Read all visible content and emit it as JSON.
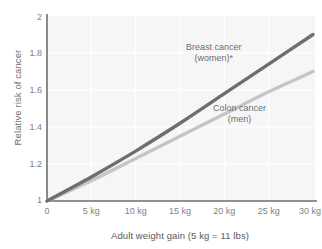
{
  "chart_data": {
    "type": "line",
    "title": "",
    "xlabel": "Adult weight gain (5 kg = 11 lbs)",
    "ylabel": "Relative risk of cancer",
    "xlim": [
      0,
      30
    ],
    "ylim": [
      1,
      2
    ],
    "grid": true,
    "legend_position": "inline-annotation",
    "x_tick_labels": [
      "0",
      "5 kg",
      "10 kg",
      "15 kg",
      "20 kg",
      "25 kg",
      "30 kg"
    ],
    "x_tick_values": [
      0,
      5,
      10,
      15,
      20,
      25,
      30
    ],
    "y_tick_labels": [
      "1",
      "1.2",
      "1.4",
      "1.6",
      "1.8",
      "2"
    ],
    "y_tick_values": [
      1,
      1.2,
      1.4,
      1.6,
      1.8,
      2
    ],
    "x": [
      0,
      5,
      10,
      15,
      20,
      25,
      30
    ],
    "series": [
      {
        "name": "Breast cancer (women)*",
        "color": "#6d6e71",
        "values": [
          1.0,
          1.13,
          1.27,
          1.42,
          1.58,
          1.74,
          1.9
        ]
      },
      {
        "name": "Colon cancer (men)",
        "color": "#c4c5c7",
        "values": [
          1.0,
          1.11,
          1.23,
          1.35,
          1.47,
          1.59,
          1.7
        ]
      }
    ],
    "annotations": [
      {
        "id": "breast",
        "line1": "Breast cancer",
        "line2": "(women)*"
      },
      {
        "id": "colon",
        "line1": "Colon cancer",
        "line2": "(men)"
      }
    ]
  },
  "style": {
    "plot_background": "#f6f6f6",
    "gridline_color": "#ffffff",
    "axis_color": "#6d6e71",
    "text_color": "#58595b"
  }
}
